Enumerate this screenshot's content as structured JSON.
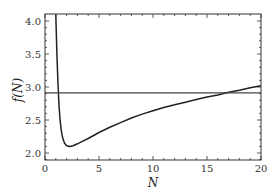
{
  "chart_data": {
    "type": "line",
    "title": "",
    "xlabel": "N",
    "ylabel": "f(N)",
    "xlim": [
      0,
      20
    ],
    "ylim": [
      1.9,
      4.1
    ],
    "x_ticks": [
      "0",
      "5",
      "10",
      "15",
      "20"
    ],
    "y_ticks": [
      "2.0",
      "2.5",
      "3.0",
      "3.5",
      "4.0"
    ],
    "grid": false,
    "legend": null,
    "series": [
      {
        "name": "f(N)",
        "color": "#222222",
        "x": [
          1.0,
          1.1,
          1.2,
          1.3,
          1.4,
          1.5,
          1.6,
          1.8,
          2.0,
          2.3,
          2.6,
          3.0,
          3.5,
          4,
          5,
          6,
          7,
          8,
          9,
          10,
          11,
          12,
          13,
          14,
          15,
          16,
          17,
          18,
          19,
          20
        ],
        "values": [
          4.1,
          3.5,
          3.05,
          2.72,
          2.5,
          2.35,
          2.25,
          2.15,
          2.11,
          2.1,
          2.11,
          2.14,
          2.18,
          2.22,
          2.31,
          2.39,
          2.46,
          2.53,
          2.59,
          2.64,
          2.69,
          2.73,
          2.77,
          2.81,
          2.85,
          2.88,
          2.92,
          2.95,
          2.99,
          3.02
        ]
      },
      {
        "name": "constant",
        "color": "#444444",
        "x": [
          0,
          20
        ],
        "values": [
          2.91,
          2.91
        ]
      }
    ]
  }
}
